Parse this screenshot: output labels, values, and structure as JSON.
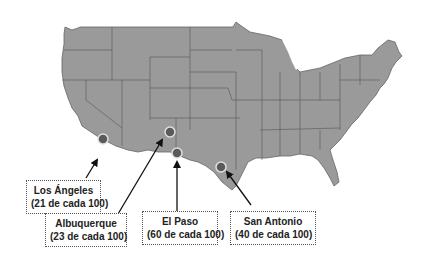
{
  "map": {
    "region": "Estados Unidos contiguos",
    "fill_color": "#9a9a9a",
    "border_color": "#555555",
    "marker_color": "#5a5a5a",
    "marker_outline": "#e0e0e0"
  },
  "cities": [
    {
      "name": "Los Ángeles",
      "stat": "(21 de cada 100)"
    },
    {
      "name": "Albuquerque",
      "stat": "(23 de cada 100)"
    },
    {
      "name": "El Paso",
      "stat": "(60 de cada 100)"
    },
    {
      "name": "San Antonio",
      "stat": "(40 de cada 100)"
    }
  ]
}
